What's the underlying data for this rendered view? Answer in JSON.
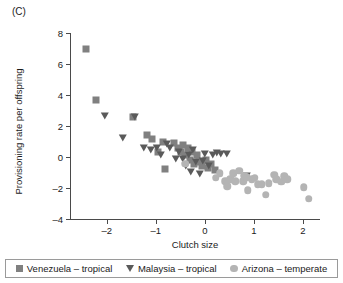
{
  "panel": {
    "label": "(C)"
  },
  "chart_data": {
    "type": "scatter",
    "title": "",
    "xlabel": "Clutch size",
    "ylabel": "Provisioning rate per offspring",
    "xlim": [
      -2.75,
      2.35
    ],
    "ylim": [
      -4,
      8
    ],
    "xticks": [
      -2,
      -1,
      0,
      1,
      2
    ],
    "xtick_labels": [
      "–2",
      "–1",
      "0",
      "1",
      "2"
    ],
    "yticks": [
      -4,
      -2,
      0,
      2,
      4,
      6,
      8
    ],
    "ytick_labels": [
      "–4",
      "–2",
      "0",
      "2",
      "4",
      "6",
      "8"
    ],
    "grid": false,
    "legend_position": "bottom",
    "series": [
      {
        "name": "Venezuela – tropical",
        "marker": "square",
        "color": "#808080",
        "points": [
          [
            -2.43,
            7.0
          ],
          [
            -2.21,
            3.7
          ],
          [
            -1.47,
            2.6
          ],
          [
            -1.18,
            1.45
          ],
          [
            -1.08,
            1.15
          ],
          [
            -0.95,
            0.35
          ],
          [
            -0.86,
            0.95
          ],
          [
            -0.82,
            -0.75
          ],
          [
            -0.62,
            0.9
          ],
          [
            -0.55,
            0.55
          ],
          [
            -0.48,
            0.3
          ],
          [
            -0.45,
            0.75
          ],
          [
            -0.4,
            0.1
          ],
          [
            -0.34,
            0.55
          ],
          [
            -0.3,
            -0.2
          ],
          [
            -0.26,
            0.35
          ],
          [
            -0.22,
            -0.45
          ],
          [
            -0.16,
            0.15
          ],
          [
            -0.12,
            -0.35
          ],
          [
            -0.06,
            -0.55
          ],
          [
            0.02,
            -0.2
          ],
          [
            0.06,
            -0.7
          ],
          [
            0.12,
            -0.45
          ],
          [
            0.2,
            -0.85
          ]
        ]
      },
      {
        "name": "Malaysia – tropical",
        "marker": "triangle-down",
        "color": "#5a5a5a",
        "points": [
          [
            -2.03,
            2.65
          ],
          [
            -1.66,
            1.25
          ],
          [
            -1.42,
            2.6
          ],
          [
            -1.24,
            0.55
          ],
          [
            -1.1,
            0.45
          ],
          [
            -0.98,
            0.6
          ],
          [
            -0.9,
            0.1
          ],
          [
            -0.78,
            0.85
          ],
          [
            -0.72,
            0.55
          ],
          [
            -0.58,
            -0.1
          ],
          [
            -0.52,
            0.35
          ],
          [
            -0.44,
            -0.1
          ],
          [
            -0.38,
            -0.6
          ],
          [
            -0.33,
            0.1
          ],
          [
            -0.28,
            -0.95
          ],
          [
            -0.24,
            0.45
          ],
          [
            -0.18,
            -0.3
          ],
          [
            -0.1,
            -1.1
          ],
          [
            -0.04,
            -0.25
          ],
          [
            0.0,
            0.2
          ],
          [
            0.08,
            -0.6
          ],
          [
            0.16,
            0.15
          ],
          [
            0.24,
            0.25
          ],
          [
            0.34,
            0.2
          ],
          [
            0.46,
            0.2
          ],
          [
            0.86,
            -1.25
          ]
        ]
      },
      {
        "name": "Arizona – temperate",
        "marker": "circle",
        "color": "#b4b4b4",
        "points": [
          [
            -0.4,
            -0.45
          ],
          [
            0.22,
            -1.35
          ],
          [
            0.3,
            -1.05
          ],
          [
            0.42,
            -1.55
          ],
          [
            0.46,
            -1.9
          ],
          [
            0.52,
            -1.45
          ],
          [
            0.58,
            -1.05
          ],
          [
            0.62,
            -1.55
          ],
          [
            0.7,
            -0.9
          ],
          [
            0.78,
            -1.55
          ],
          [
            0.8,
            -1.2
          ],
          [
            0.86,
            -1.3
          ],
          [
            0.88,
            -2.15
          ],
          [
            0.96,
            -1.45
          ],
          [
            1.02,
            -1.35
          ],
          [
            1.08,
            -1.75
          ],
          [
            1.16,
            -1.75
          ],
          [
            1.24,
            -2.45
          ],
          [
            1.3,
            -1.7
          ],
          [
            1.42,
            -1.15
          ],
          [
            1.46,
            -1.45
          ],
          [
            1.56,
            -1.6
          ],
          [
            1.62,
            -1.25
          ],
          [
            1.68,
            -1.45
          ],
          [
            2.02,
            -1.95
          ],
          [
            2.12,
            -2.7
          ]
        ]
      }
    ]
  }
}
